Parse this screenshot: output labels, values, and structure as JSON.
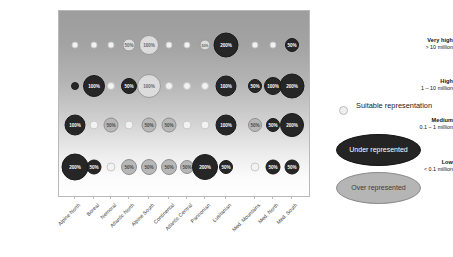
{
  "chart_data": {
    "type": "heatmap",
    "title": "",
    "xlabel": "",
    "ylabel": "",
    "grid": false,
    "legend_position": "right",
    "categories": [
      "Alpine North",
      "Boreal",
      "Nemoral",
      "Atlantic North",
      "Alpine South",
      "Continental",
      "Atlantic Central",
      "Pannonian",
      "Lusitanian",
      "Med. Mountains",
      "Med. North",
      "Med. South"
    ],
    "rows": [
      {
        "label_line1": "Very high",
        "label_line2": "> 10 million"
      },
      {
        "label_line1": "High",
        "label_line2": "1 – 10 million"
      },
      {
        "label_line1": "Medium",
        "label_line2": "0.1 – 1 million"
      },
      {
        "label_line1": "Low",
        "label_line2": "< 0.1 million"
      }
    ],
    "bubbles": [
      {
        "row": 0,
        "col": 0,
        "class": "suitable",
        "size": 7,
        "label": ""
      },
      {
        "row": 0,
        "col": 1,
        "class": "suitable",
        "size": 7,
        "label": ""
      },
      {
        "row": 0,
        "col": 2,
        "class": "suitable",
        "size": 7,
        "label": ""
      },
      {
        "row": 0,
        "col": 3,
        "class": "over-pale",
        "size": 13,
        "label": "50%"
      },
      {
        "row": 0,
        "col": 4,
        "class": "over-pale",
        "size": 20,
        "label": "100%"
      },
      {
        "row": 0,
        "col": 5,
        "class": "suitable",
        "size": 7,
        "label": ""
      },
      {
        "row": 0,
        "col": 6,
        "class": "suitable",
        "size": 7,
        "label": ""
      },
      {
        "row": 0,
        "col": 7,
        "class": "over-pale",
        "size": 11,
        "label": "50%"
      },
      {
        "row": 0,
        "col": 8,
        "class": "under",
        "size": 25,
        "label": "200%"
      },
      {
        "row": 0,
        "col": 9,
        "class": "suitable",
        "size": 7,
        "label": ""
      },
      {
        "row": 0,
        "col": 10,
        "class": "suitable",
        "size": 7,
        "label": ""
      },
      {
        "row": 0,
        "col": 11,
        "class": "under",
        "size": 14,
        "label": "50%"
      },
      {
        "row": 1,
        "col": 0,
        "class": "under",
        "size": 8,
        "label": ""
      },
      {
        "row": 1,
        "col": 1,
        "class": "under",
        "size": 22,
        "label": "100%"
      },
      {
        "row": 1,
        "col": 2,
        "class": "suitable",
        "size": 8,
        "label": ""
      },
      {
        "row": 1,
        "col": 3,
        "class": "under",
        "size": 16,
        "label": "50%"
      },
      {
        "row": 1,
        "col": 4,
        "class": "over-pale",
        "size": 24,
        "label": "100%"
      },
      {
        "row": 1,
        "col": 5,
        "class": "suitable",
        "size": 8,
        "label": ""
      },
      {
        "row": 1,
        "col": 6,
        "class": "suitable",
        "size": 8,
        "label": ""
      },
      {
        "row": 1,
        "col": 7,
        "class": "suitable",
        "size": 8,
        "label": ""
      },
      {
        "row": 1,
        "col": 8,
        "class": "under",
        "size": 21,
        "label": "100%"
      },
      {
        "row": 1,
        "col": 9,
        "class": "under",
        "size": 14,
        "label": "50%"
      },
      {
        "row": 1,
        "col": 10,
        "class": "under",
        "size": 18,
        "label": "100%"
      },
      {
        "row": 1,
        "col": 11,
        "class": "under",
        "size": 25,
        "label": "200%"
      },
      {
        "row": 2,
        "col": 0,
        "class": "under",
        "size": 21,
        "label": "100%"
      },
      {
        "row": 2,
        "col": 1,
        "class": "suitable",
        "size": 9,
        "label": ""
      },
      {
        "row": 2,
        "col": 2,
        "class": "over",
        "size": 15,
        "label": "50%"
      },
      {
        "row": 2,
        "col": 3,
        "class": "suitable",
        "size": 9,
        "label": ""
      },
      {
        "row": 2,
        "col": 4,
        "class": "over",
        "size": 15,
        "label": "50%"
      },
      {
        "row": 2,
        "col": 5,
        "class": "over",
        "size": 15,
        "label": "50%"
      },
      {
        "row": 2,
        "col": 6,
        "class": "suitable",
        "size": 9,
        "label": ""
      },
      {
        "row": 2,
        "col": 7,
        "class": "suitable",
        "size": 9,
        "label": ""
      },
      {
        "row": 2,
        "col": 8,
        "class": "under",
        "size": 21,
        "label": "100%"
      },
      {
        "row": 2,
        "col": 9,
        "class": "over",
        "size": 14,
        "label": "50%"
      },
      {
        "row": 2,
        "col": 10,
        "class": "under",
        "size": 14,
        "label": "50%"
      },
      {
        "row": 2,
        "col": 11,
        "class": "under",
        "size": 24,
        "label": "200%"
      },
      {
        "row": 3,
        "col": 0,
        "class": "under",
        "size": 27,
        "label": "200%"
      },
      {
        "row": 3,
        "col": 1,
        "class": "under",
        "size": 15,
        "label": "50%"
      },
      {
        "row": 3,
        "col": 2,
        "class": "suitable",
        "size": 9,
        "label": ""
      },
      {
        "row": 3,
        "col": 3,
        "class": "over",
        "size": 16,
        "label": "50%"
      },
      {
        "row": 3,
        "col": 4,
        "class": "over",
        "size": 16,
        "label": "50%"
      },
      {
        "row": 3,
        "col": 5,
        "class": "over",
        "size": 16,
        "label": "50%"
      },
      {
        "row": 3,
        "col": 6,
        "class": "over",
        "size": 14,
        "label": "50%"
      },
      {
        "row": 3,
        "col": 7,
        "class": "under",
        "size": 26,
        "label": "200%"
      },
      {
        "row": 3,
        "col": 8,
        "class": "under",
        "size": 14,
        "label": "50%"
      },
      {
        "row": 3,
        "col": 9,
        "class": "suitable",
        "size": 9,
        "label": ""
      },
      {
        "row": 3,
        "col": 10,
        "class": "under",
        "size": 15,
        "label": "50%"
      },
      {
        "row": 3,
        "col": 11,
        "class": "under",
        "size": 15,
        "label": "50%"
      }
    ]
  },
  "legend": {
    "suitable_label": "Suitable representation",
    "under_label": "Under represented",
    "over_label": "Over represented"
  },
  "colors": {
    "suitable": "#f2f2f2",
    "under": "#262626",
    "over": "#b7b7b7",
    "over_pale": "#dcdcdc",
    "frame": "#b9b9b9"
  }
}
